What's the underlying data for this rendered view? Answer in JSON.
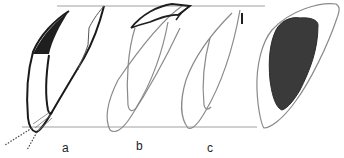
{
  "diagram": {
    "type": "line-drawing",
    "colors": {
      "outline_dark": "#1a1a1a",
      "outline_light": "#7a7a7a",
      "fill_dark": "#2a2a2a",
      "fill_shaded": "#3a3a3a",
      "reference_line": "#999999"
    },
    "labels": [
      {
        "id": "a",
        "text": "a",
        "x": 62,
        "y": 142
      },
      {
        "id": "b",
        "text": "b",
        "x": 136,
        "y": 140
      },
      {
        "id": "c",
        "text": "c",
        "x": 207,
        "y": 142
      }
    ],
    "figures": [
      {
        "id": "a",
        "note": "dark outline with black filled top region and dotted extension lines at bottom"
      },
      {
        "id": "b",
        "note": "light outline with dark curved cap at top"
      },
      {
        "id": "c",
        "note": "light outline with small dark mark at top"
      },
      {
        "id": "d",
        "note": "unlabeled outline with large shaded interior region"
      }
    ]
  }
}
